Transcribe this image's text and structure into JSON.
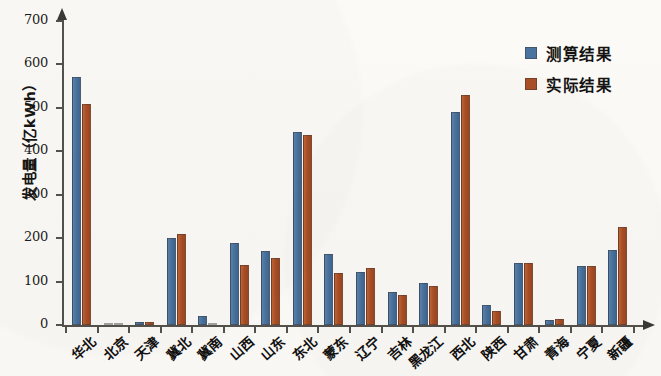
{
  "chart_data": {
    "type": "bar",
    "title": "",
    "xlabel": "",
    "ylabel": "发电量（亿kWh）",
    "ylim": [
      0,
      700
    ],
    "y_ticks": [
      0,
      100,
      200,
      300,
      400,
      500,
      600,
      700
    ],
    "grid": false,
    "legend_position": "top-right",
    "categories": [
      "华北",
      "北京",
      "天津",
      "冀北",
      "冀南",
      "山西",
      "山东",
      "东北",
      "蒙东",
      "辽宁",
      "吉林",
      "黑龙江",
      "西北",
      "陕西",
      "甘肃",
      "青海",
      "宁夏",
      "新疆"
    ],
    "series": [
      {
        "name": "测算结果",
        "color": "#4a739f",
        "values": [
          570,
          4,
          8,
          201,
          20,
          189,
          170,
          445,
          163,
          122,
          75,
          97,
          490,
          45,
          142,
          12,
          135,
          172
        ]
      },
      {
        "name": "实际结果",
        "color": "#ab4f26",
        "values": [
          508,
          3,
          6,
          210,
          5,
          139,
          155,
          437,
          120,
          132,
          68,
          90,
          530,
          32,
          142,
          15,
          137,
          225
        ]
      }
    ]
  },
  "legend": {
    "items": [
      {
        "label": "测算结果",
        "color": "#4a739f"
      },
      {
        "label": "实际结果",
        "color": "#ab4f26"
      }
    ]
  },
  "axis": {
    "y_label": "发电量（亿kWh）",
    "y_tick_labels": [
      "700",
      "600",
      "500",
      "400",
      "300",
      "200",
      "100",
      "0"
    ]
  }
}
